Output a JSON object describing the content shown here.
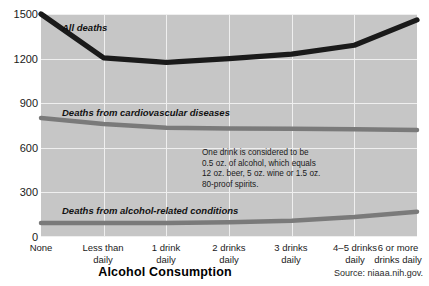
{
  "chart_data": {
    "type": "line",
    "title": "",
    "xlabel": "Alcohol Consumption",
    "ylabel": "",
    "ylim": [
      0,
      1500
    ],
    "yticks": [
      0,
      300,
      600,
      900,
      1200,
      1500
    ],
    "grid": true,
    "legend_position": "inline-labels",
    "categories": [
      "None",
      "Less than daily",
      "1 drink daily",
      "2 drinks daily",
      "3 drinks daily",
      "4–5 drinks daily",
      "6 or more drinks daily"
    ],
    "series": [
      {
        "name": "All deaths",
        "color": "#1a1a1a",
        "values": [
          1500,
          1205,
          1175,
          1200,
          1230,
          1290,
          1460
        ]
      },
      {
        "name": "Deaths from cardiovascular diseases",
        "color": "#7a7a7a",
        "values": [
          800,
          760,
          735,
          730,
          728,
          725,
          720
        ]
      },
      {
        "name": "Deaths from alcohol-related conditions",
        "color": "#7a7a7a",
        "values": [
          95,
          95,
          95,
          100,
          110,
          135,
          170
        ]
      }
    ],
    "annotations": [
      "One drink is considered to be",
      "0.5 oz. of alcohol, which equals",
      "12 oz. beer, 5 oz. wine or 1.5 oz.",
      "80-proof spirits."
    ],
    "source": "Source: niaaa.nih.gov."
  },
  "xtick_labels": [
    {
      "line1": "None",
      "line2": ""
    },
    {
      "line1": "Less than",
      "line2": "daily"
    },
    {
      "line1": "1 drink",
      "line2": "daily"
    },
    {
      "line1": "2 drinks",
      "line2": "daily"
    },
    {
      "line1": "3 drinks",
      "line2": "daily"
    },
    {
      "line1": "4–5 drinks",
      "line2": "daily"
    },
    {
      "line1": "6 or more",
      "line2": "drinks daily"
    }
  ],
  "ytick_labels": [
    "1500",
    "1200",
    "900",
    "600",
    "300",
    "0"
  ],
  "series_labels": {
    "all_deaths": "All deaths",
    "cardiovascular": "Deaths from cardiovascular diseases",
    "alcohol_related": "Deaths from alcohol-related conditions"
  },
  "annotation_lines": {
    "l1": "One drink is considered to be",
    "l2": "0.5 oz. of alcohol, which equals",
    "l3": "12 oz. beer, 5 oz. wine or 1.5 oz.",
    "l4": "80-proof spirits."
  },
  "axis_title": "Alcohol Consumption",
  "source_text": "Source: niaaa.nih.gov."
}
